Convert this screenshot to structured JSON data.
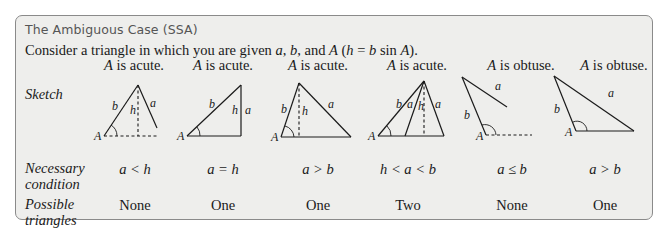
{
  "title": "The Ambiguous Case (SSA)",
  "intro": {
    "prefix": "Consider a triangle in which you are given ",
    "var_a": "a",
    "sep1": ", ",
    "var_b": "b",
    "sep2": ", and ",
    "var_A": "A",
    "paren_open": " (",
    "var_h": "h",
    "eq": " = ",
    "var_b2": "b",
    "sin": " sin ",
    "var_A2": "A",
    "paren_close": ")."
  },
  "row_labels": {
    "sketch": "Sketch",
    "condition_line1": "Necessary",
    "condition_line2": "condition",
    "triangles_line1": "Possible",
    "triangles_line2": "triangles"
  },
  "cases": [
    {
      "angle_var": "A",
      "angle_type": " is acute.",
      "condition": "a < h",
      "possible": "None",
      "labels": {
        "vertex": "A",
        "b": "b",
        "h": "h",
        "a": "a"
      }
    },
    {
      "angle_var": "A",
      "angle_type": " is acute.",
      "condition": "a = h",
      "possible": "One",
      "labels": {
        "vertex": "A",
        "b": "b",
        "h": "h",
        "a": "a"
      }
    },
    {
      "angle_var": "A",
      "angle_type": " is acute.",
      "condition": "a > b",
      "possible": "One",
      "labels": {
        "vertex": "A",
        "b": "b",
        "h": "h",
        "a": "a"
      }
    },
    {
      "angle_var": "A",
      "angle_type": " is acute.",
      "condition": "h < a < b",
      "possible": "Two",
      "labels": {
        "vertex": "A",
        "b": "b",
        "h": "h",
        "a": "a",
        "a2": "a"
      }
    },
    {
      "angle_var": "A",
      "angle_type": " is obtuse.",
      "condition": "a ≤ b",
      "possible": "None",
      "labels": {
        "vertex": "A",
        "b": "b",
        "a": "a"
      }
    },
    {
      "angle_var": "A",
      "angle_type": " is obtuse.",
      "condition": "a > b",
      "possible": "One",
      "labels": {
        "vertex": "A",
        "b": "b",
        "a": "a"
      }
    }
  ]
}
